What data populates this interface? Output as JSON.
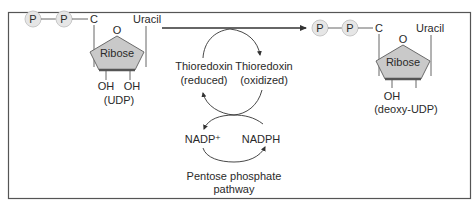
{
  "diagram": {
    "left_molecule": {
      "phosphate_1": "P",
      "phosphate_2": "P",
      "carbon": "C",
      "ring_oxygen": "O",
      "base": "Uracil",
      "sugar": "Ribose",
      "hydroxyl_left": "OH",
      "hydroxyl_right": "OH",
      "name": "(UDP)"
    },
    "right_molecule": {
      "phosphate_1": "P",
      "phosphate_2": "P",
      "carbon": "C",
      "ring_oxygen": "O",
      "base": "Uracil",
      "sugar": "Ribose",
      "hydroxyl": "OH",
      "name": "(deoxy-UDP)"
    },
    "thioredoxin_reduced": [
      "Thioredoxin",
      "(reduced)"
    ],
    "thioredoxin_oxidized": [
      "Thioredoxin",
      "(oxidized)"
    ],
    "nadp_plus": "NADP⁺",
    "nadph": "NADPH",
    "pathway": [
      "Pentose phosphate",
      "pathway"
    ],
    "colors": {
      "border": "#555555",
      "circle_fill": "#e6e6e6",
      "circle_stroke": "#c8c8c8",
      "ribose_fill": "#c9c9c9",
      "ribose_stroke": "#6a6a6a",
      "line": "#333333",
      "text": "#2a2a2a"
    }
  }
}
